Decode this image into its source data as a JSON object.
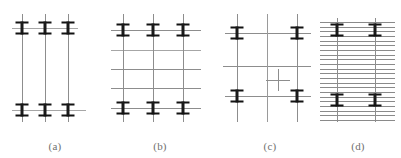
{
  "figure": {
    "background_color": "#ffffff",
    "line_color": "#8d8d8d",
    "faint_line_color": "#a6a6a6",
    "connector_color": "#121212",
    "caption_color": "#6f6f6f",
    "width": 401,
    "height": 158
  },
  "panels": [
    {
      "id": "panel-a",
      "caption": "(a)",
      "left": 0,
      "width": 110,
      "description": "three vertical posts with I-beam connectors at top and bottom, short horizontal stubs",
      "verticals": [
        {
          "x": 22,
          "top": 14,
          "bottom": 122,
          "thin": false
        },
        {
          "x": 45,
          "top": 14,
          "bottom": 122,
          "thin": false
        },
        {
          "x": 68,
          "top": 14,
          "bottom": 122,
          "thin": false
        }
      ],
      "ibeams": [
        {
          "x": 22,
          "y": 28
        },
        {
          "x": 45,
          "y": 28
        },
        {
          "x": 68,
          "y": 28
        },
        {
          "x": 22,
          "y": 110
        },
        {
          "x": 45,
          "y": 110
        },
        {
          "x": 68,
          "y": 110
        }
      ],
      "horizontals": [
        {
          "x1": 12,
          "x2": 78,
          "y": 28,
          "faint": true
        },
        {
          "x1": 12,
          "x2": 86,
          "y": 110,
          "faint": true
        }
      ],
      "crosses": []
    },
    {
      "id": "panel-b",
      "caption": "(b)",
      "left": 105,
      "width": 110,
      "description": "three vertical posts with I-beams top and bottom plus three intermediate horizontal rails",
      "verticals": [
        {
          "x": 18,
          "top": 14,
          "bottom": 122,
          "thin": false
        },
        {
          "x": 48,
          "top": 14,
          "bottom": 122,
          "thin": false
        },
        {
          "x": 78,
          "top": 14,
          "bottom": 122,
          "thin": false
        }
      ],
      "ibeams": [
        {
          "x": 18,
          "y": 30
        },
        {
          "x": 48,
          "y": 30
        },
        {
          "x": 78,
          "y": 30
        },
        {
          "x": 18,
          "y": 108
        },
        {
          "x": 48,
          "y": 108
        },
        {
          "x": 78,
          "y": 108
        }
      ],
      "horizontals": [
        {
          "x1": 6,
          "x2": 96,
          "y": 30,
          "faint": false
        },
        {
          "x1": 6,
          "x2": 96,
          "y": 50,
          "faint": true
        },
        {
          "x1": 6,
          "x2": 96,
          "y": 69,
          "faint": false
        },
        {
          "x1": 6,
          "x2": 96,
          "y": 88,
          "faint": false
        },
        {
          "x1": 6,
          "x2": 96,
          "y": 108,
          "faint": false
        }
      ],
      "crosses": []
    },
    {
      "id": "panel-c",
      "caption": "(c)",
      "left": 215,
      "width": 110,
      "description": "two I-beam posts flanking a plain middle post with three horizontal rails and a small free cross",
      "verticals": [
        {
          "x": 22,
          "top": 14,
          "bottom": 122,
          "thin": false
        },
        {
          "x": 52,
          "top": 14,
          "bottom": 122,
          "thin": true
        },
        {
          "x": 82,
          "top": 14,
          "bottom": 122,
          "thin": false
        }
      ],
      "ibeams": [
        {
          "x": 22,
          "y": 33
        },
        {
          "x": 82,
          "y": 33
        },
        {
          "x": 22,
          "y": 96
        },
        {
          "x": 82,
          "y": 96
        }
      ],
      "horizontals": [
        {
          "x1": 10,
          "x2": 96,
          "y": 33,
          "faint": false
        },
        {
          "x1": 8,
          "x2": 96,
          "y": 66,
          "faint": false
        },
        {
          "x1": 10,
          "x2": 96,
          "y": 96,
          "faint": false
        }
      ],
      "crosses": [
        {
          "x": 63,
          "y": 80,
          "w": 24,
          "h": 22
        }
      ]
    },
    {
      "id": "panel-d",
      "caption": "(d)",
      "left": 315,
      "width": 86,
      "description": "two I-beam posts crossed by a dense stack of closely spaced horizontal rails",
      "verticals": [
        {
          "x": 22,
          "top": 18,
          "bottom": 122,
          "thin": false
        },
        {
          "x": 60,
          "top": 18,
          "bottom": 122,
          "thin": false
        }
      ],
      "ibeams": [
        {
          "x": 22,
          "y": 30
        },
        {
          "x": 60,
          "y": 30
        },
        {
          "x": 22,
          "y": 100
        },
        {
          "x": 60,
          "y": 100
        }
      ],
      "dense_rails": {
        "x1": 5,
        "x2": 80,
        "y_start": 22,
        "y_end": 120,
        "count": 22
      },
      "horizontals": [],
      "crosses": []
    }
  ]
}
